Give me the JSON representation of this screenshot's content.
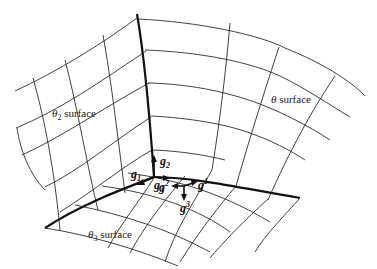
{
  "diagram": {
    "type": "curvilinear coordinate surfaces with base vectors",
    "labels": {
      "theta2_surface": {
        "symbol": "θ",
        "sub": "2",
        "text": " surface"
      },
      "theta_surface": {
        "symbol": "θ",
        "text": " surface"
      },
      "theta3_surface": {
        "symbol": "θ",
        "sub": "3",
        "text": " surface"
      }
    },
    "covariant_vectors": [
      {
        "base": "g",
        "index": "1",
        "position": "subscript"
      },
      {
        "base": "g",
        "index": "2",
        "position": "subscript"
      },
      {
        "base": "g",
        "index": "3",
        "position": "subscript"
      }
    ],
    "contravariant_vectors": [
      {
        "base": "g",
        "index": "1",
        "position": "superscript"
      },
      {
        "base": "g",
        "index": "2",
        "position": "superscript"
      },
      {
        "base": "g",
        "index": "3",
        "position": "superscript"
      }
    ],
    "colors": {
      "line": "#2a2a2a",
      "edge": "#111111",
      "background": "#ffffff"
    }
  }
}
